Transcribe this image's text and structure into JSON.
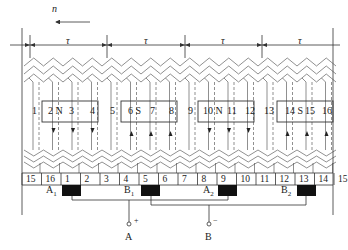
{
  "direction": {
    "label": "n",
    "arrow": "left"
  },
  "pole_pitch_label": "τ",
  "pole_pitches": [
    "τ",
    "τ",
    "τ",
    "τ"
  ],
  "slots": [
    "1",
    "2",
    "3",
    "4",
    "5",
    "6",
    "7",
    "8",
    "9",
    "10",
    "11",
    "12",
    "13",
    "14",
    "15",
    "16"
  ],
  "poles": [
    {
      "name": "N",
      "slot_label": "2 N",
      "after": "3",
      "end": "4"
    },
    {
      "name": "S",
      "slot_label": "6 S",
      "after": "7",
      "end": "8"
    },
    {
      "name": "N",
      "slot_label": "10 N",
      "after": "11",
      "end": "12"
    },
    {
      "name": "S",
      "slot_label": "14 S",
      "after": "15",
      "end": "16"
    }
  ],
  "commutator_segments": [
    "15",
    "16",
    "1",
    "2",
    "3",
    "4",
    "5",
    "6",
    "7",
    "8",
    "9",
    "10",
    "11",
    "12",
    "13",
    "14",
    "15"
  ],
  "brushes": [
    {
      "label": "A",
      "sub": "1"
    },
    {
      "label": "B",
      "sub": "1"
    },
    {
      "label": "A",
      "sub": "2"
    },
    {
      "label": "B",
      "sub": "2"
    }
  ],
  "terminals": [
    {
      "label": "A",
      "polarity": "+"
    },
    {
      "label": "B",
      "polarity": "−"
    }
  ],
  "colors": {
    "line": "#333333",
    "brush": "#111111",
    "background": "#ffffff"
  }
}
